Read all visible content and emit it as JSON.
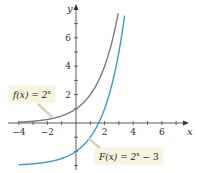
{
  "chart_data": {
    "type": "line",
    "title": "",
    "xlabel": "x",
    "ylabel": "y",
    "xlim": [
      -4.5,
      7.3
    ],
    "ylim": [
      -3.5,
      8.3
    ],
    "x_ticks": [
      -4,
      -2,
      2,
      4,
      6
    ],
    "y_ticks": [
      2,
      4,
      6
    ],
    "grid": false,
    "series": [
      {
        "name": "f(x) = 2^x",
        "color": "#7a7a7a",
        "formula": "2^x",
        "x": [
          -4,
          -3,
          -2,
          -1,
          0,
          1,
          2,
          2.5,
          2.95
        ],
        "y": [
          0.0625,
          0.125,
          0.25,
          0.5,
          1,
          2,
          4,
          5.66,
          7.73
        ]
      },
      {
        "name": "F(x) = 2^x - 3",
        "color": "#3a9ad9",
        "formula": "2^x - 3",
        "x": [
          -4,
          -3,
          -2,
          -1,
          0,
          1,
          1.585,
          2,
          3,
          3.4
        ],
        "y": [
          -2.9375,
          -2.875,
          -2.75,
          -2.5,
          -2,
          -1,
          0,
          1,
          5,
          7.56
        ]
      }
    ],
    "annotations": [
      {
        "text": "f(x) = 2^x",
        "target_series": 0
      },
      {
        "text": "F(x) = 2^x − 3",
        "target_series": 1
      }
    ]
  },
  "labels": {
    "x_axis": "x",
    "y_axis": "y",
    "x_ticks": [
      "−4",
      "−2",
      "2",
      "4",
      "6"
    ],
    "y_ticks": [
      "2",
      "4",
      "6"
    ],
    "callout_f_prefix": "f(x) = 2",
    "callout_f_exp": "x",
    "callout_F_prefix": "F(x) = 2",
    "callout_F_exp": "x",
    "callout_F_suffix": " − 3"
  },
  "colors": {
    "f_curve": "#7a7a7a",
    "F_curve": "#3a9ad9",
    "axis": "#333333",
    "callout_bg": "#f7f3df"
  }
}
